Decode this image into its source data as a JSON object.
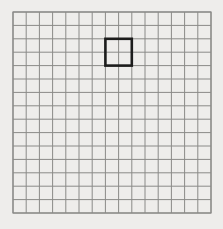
{
  "figure": {
    "name": "grid-with-highlighted-square",
    "background_color": "#eeedeb",
    "width": 223,
    "height": 229
  },
  "grid": {
    "label": "grid",
    "columns": 15,
    "rows": 15,
    "origin_x": 13,
    "origin_y": 12,
    "cell_width": 13.2,
    "cell_height": 13.4,
    "line_color": "#8a8a88",
    "line_width": 1,
    "border_color": "#8a8a88",
    "border_width": 1.2
  },
  "highlight": {
    "label": "highlighted-square",
    "col_start": 7,
    "row_start": 2,
    "col_span": 2,
    "row_span": 2,
    "x": 105,
    "y": 38.8,
    "width": 26.4,
    "height": 26.8,
    "stroke_color": "#1c1c1c",
    "stroke_width": 2.6,
    "fill": "none"
  },
  "chart_data": {
    "type": "heatmap",
    "title": "",
    "xlabel": "",
    "ylabel": "",
    "grid": true,
    "legend": "none",
    "categories": [],
    "values": [],
    "annotations": [
      {
        "kind": "rectangle-outline",
        "col": 7,
        "row": 2,
        "col_span": 2,
        "row_span": 2,
        "color": "#1c1c1c",
        "text": ""
      }
    ],
    "axis_ranges": {
      "x": [
        0,
        15
      ],
      "y": [
        0,
        15
      ]
    }
  }
}
